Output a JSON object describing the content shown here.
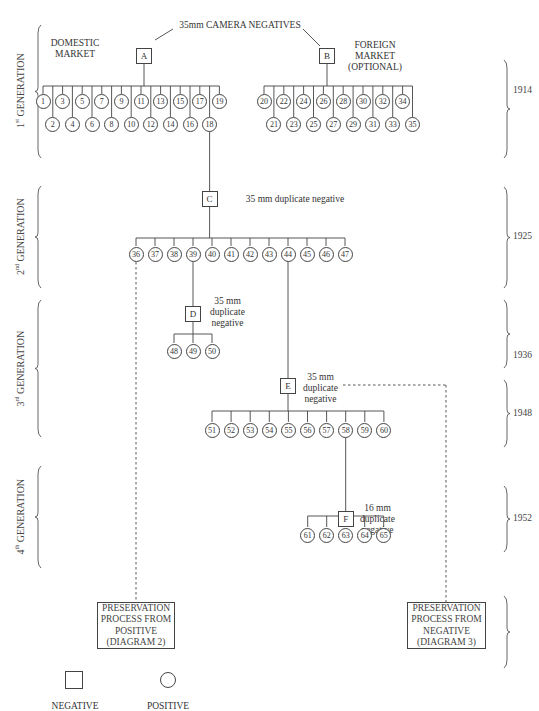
{
  "title": "35mm CAMERA NEGATIVES",
  "markets": {
    "domestic": "DOMESTIC\nMARKET",
    "foreign": "FOREIGN\nMARKET\n(OPTIONAL)"
  },
  "negatives": [
    {
      "id": "A",
      "label": ""
    },
    {
      "id": "B",
      "label": ""
    },
    {
      "id": "C",
      "label": "35 mm duplicate negative"
    },
    {
      "id": "D",
      "label": "35 mm\nduplicate\nnegative"
    },
    {
      "id": "E",
      "label": "35 mm\nduplicate\nnegative"
    },
    {
      "id": "F",
      "label": "16 mm\nduplicate\nnegative"
    }
  ],
  "generations": [
    {
      "label": "1st GENERATION",
      "sup": "st",
      "base": "1",
      "rest": " GENERATION"
    },
    {
      "label": "2nd GENERATION",
      "sup": "nd",
      "base": "2",
      "rest": " GENERATION"
    },
    {
      "label": "3rd GENERATION",
      "sup": "rd",
      "base": "3",
      "rest": " GENERATION"
    },
    {
      "label": "4th GENERATION",
      "sup": "th",
      "base": "4",
      "rest": " GENERATION"
    }
  ],
  "years": [
    "1914",
    "1925",
    "1936",
    "1948",
    "1952"
  ],
  "positives": {
    "A_odd": [
      "1",
      "3",
      "5",
      "7",
      "9",
      "11",
      "13",
      "15",
      "17",
      "19"
    ],
    "A_even": [
      "2",
      "4",
      "6",
      "8",
      "10",
      "12",
      "14",
      "16",
      "18"
    ],
    "B_even": [
      "20",
      "22",
      "24",
      "26",
      "28",
      "30",
      "32",
      "34"
    ],
    "B_odd": [
      "21",
      "23",
      "25",
      "27",
      "29",
      "31",
      "33",
      "35"
    ],
    "C": [
      "36",
      "37",
      "38",
      "39",
      "40",
      "41",
      "42",
      "43",
      "44",
      "45",
      "46",
      "47"
    ],
    "D": [
      "48",
      "49",
      "50"
    ],
    "E": [
      "51",
      "52",
      "53",
      "54",
      "55",
      "56",
      "57",
      "58",
      "59",
      "60"
    ],
    "F": [
      "61",
      "62",
      "63",
      "64",
      "65"
    ]
  },
  "preservation": {
    "positive": "PRESERVATION\nPROCESS FROM\nPOSITIVE\n(DIAGRAM 2)",
    "negative": "PRESERVATION\nPROCESS FROM\nNEGATIVE\n(DIAGRAM 3)"
  },
  "legend": {
    "negative": "NEGATIVE",
    "positive": "POSITIVE"
  }
}
